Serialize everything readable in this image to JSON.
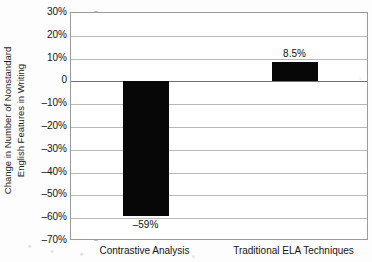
{
  "chart_data": {
    "type": "bar",
    "title": "",
    "subtitle": "",
    "xlabel": "",
    "ylabel": "Change in Number of Nonstandard English Features in Writing",
    "ylabel_lines": [
      "Change in Number of Nonstandard",
      "English Features in Writing"
    ],
    "categories": [
      "Contrastive Analysis",
      "Traditional ELA Techniques"
    ],
    "values": [
      -59,
      8.5
    ],
    "data_labels": [
      "–59%",
      "8.5%"
    ],
    "ylim": [
      -70,
      30
    ],
    "ytick_values": [
      30,
      20,
      10,
      0,
      -10,
      -20,
      -30,
      -40,
      -50,
      -60,
      -70
    ],
    "ytick_labels": [
      "30%",
      "20%",
      "10%",
      "0",
      "–10%",
      "–20%",
      "–30%",
      "–40%",
      "–50%",
      "–60%",
      "–70%"
    ],
    "grid": true,
    "grid_axis": "y",
    "legend": false,
    "legend_position": "none",
    "bar_color": "#070707",
    "grid_color": "#b9b9b9",
    "zero_line_color": "#6e6e6e",
    "frame_color": "#9a9a9a",
    "background_color": "#ffffff",
    "label_positions": [
      "below-bar",
      "above-bar"
    ]
  }
}
